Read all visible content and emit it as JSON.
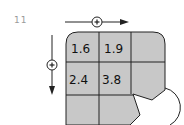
{
  "problem": {
    "number": "11"
  },
  "diagram": {
    "horizontal_arrow": {
      "symbol": "+",
      "direction": "right"
    },
    "vertical_arrow": {
      "symbol": "+",
      "direction": "down"
    },
    "grid": {
      "columns": 3,
      "rows": 3,
      "cells": [
        [
          "1.6",
          "1.9",
          ""
        ],
        [
          "2.4",
          "3.8",
          ""
        ],
        [
          "",
          "",
          ""
        ]
      ],
      "fill_color": "#c8c8c8",
      "line_color": "#222222",
      "bite_corner": "bottom-right"
    }
  }
}
